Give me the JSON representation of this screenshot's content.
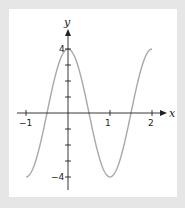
{
  "chart_data": {
    "type": "line",
    "title": "",
    "xlabel": "x",
    "ylabel": "y",
    "xlim": [
      -1,
      2
    ],
    "ylim": [
      -4,
      4
    ],
    "grid": false,
    "legend": null,
    "x_tick_labels": [
      "-1",
      "1",
      "2"
    ],
    "y_tick_labels": [
      "4",
      "-4"
    ],
    "x_ticks": [
      -1,
      0,
      1,
      2
    ],
    "y_ticks": [
      -4,
      -3,
      -2,
      -1,
      1,
      2,
      3,
      4
    ],
    "series": [
      {
        "name": "y = 4cos(πx)",
        "function": "4*cos(pi*x)",
        "x": [
          -1,
          -0.75,
          -0.5,
          -0.25,
          0,
          0.25,
          0.5,
          0.75,
          1,
          1.25,
          1.5,
          1.75,
          2
        ],
        "values": [
          -4,
          -2.83,
          0,
          2.83,
          4,
          2.83,
          0,
          -2.83,
          -4,
          -2.83,
          0,
          2.83,
          4
        ],
        "color": "#a8a8a8"
      }
    ]
  },
  "axes": {
    "x_label": "x",
    "y_label": "y",
    "x_ticks": {
      "neg1": "−1",
      "one": "1",
      "two": "2"
    },
    "y_ticks": {
      "four": "4",
      "neg4": "−4"
    }
  },
  "colors": {
    "background": "#e6e6e6",
    "panel": "#ffffff",
    "axis": "#222222",
    "curve": "#a8a8a8"
  }
}
